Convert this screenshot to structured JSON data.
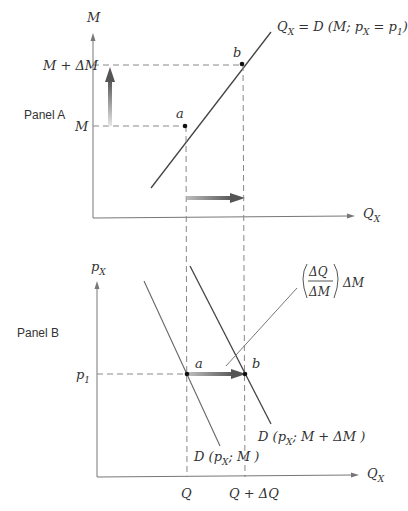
{
  "panels": {
    "a": {
      "title": "Panel A",
      "y_axis_label": "M",
      "x_axis_label": "Q",
      "x_axis_sub": "X",
      "y_tick_low": "M",
      "y_tick_high": "M + ΔM",
      "curve_label_main": "Q",
      "curve_label_sub": "X",
      "curve_label_rest1": " = D (M; p",
      "curve_label_sub2": "X",
      "curve_label_rest2": " = p",
      "curve_label_sub3": "1",
      "curve_label_rest3": ")",
      "point_a": "a",
      "point_b": "b"
    },
    "b": {
      "title": "Panel B",
      "y_axis_label": "p",
      "y_axis_sub": "X",
      "x_axis_label": "Q",
      "x_axis_sub": "X",
      "y_tick": "p",
      "y_tick_sub": "1",
      "x_tick_low": "Q",
      "x_tick_high": "Q + ΔQ",
      "point_a": "a",
      "point_b": "b",
      "curve1_label_pre": "D (p",
      "curve1_label_sub": "X",
      "curve1_label_post": "; M )",
      "curve2_label_pre": "D (p",
      "curve2_label_sub": "X",
      "curve2_label_post": "; M  + ΔM )",
      "annotation_numerator": "ΔQ",
      "annotation_denominator": "ΔM",
      "annotation_suffix": "ΔM"
    }
  },
  "colors": {
    "axis": "#777777",
    "curve": "#444444",
    "dash": "#888888",
    "arrow_dark": "#555555",
    "arrow_light": "#dddddd"
  }
}
